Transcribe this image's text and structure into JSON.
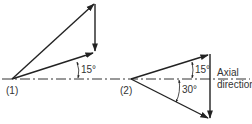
{
  "diagram": {
    "case1": {
      "label": "(1)",
      "angle_label": "15°"
    },
    "case2": {
      "label": "(2)",
      "upper_angle_label": "15°",
      "lower_angle_label": "30°"
    },
    "axis": {
      "line1": "Axial",
      "line2": "direction"
    }
  },
  "colors": {
    "ink": "#222222",
    "background": "#ffffff"
  }
}
